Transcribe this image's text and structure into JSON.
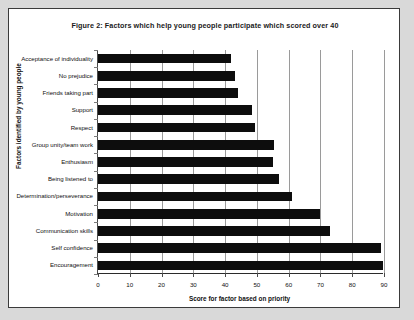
{
  "figure": {
    "title": "Figure 2: Factors which help young people participate which scored over 40",
    "xaxis_title": "Score for factor based on priority",
    "yaxis_title": "Factors identified by young people"
  },
  "chart_data": {
    "type": "bar",
    "orientation": "horizontal",
    "title": "Figure 2: Factors which help young people participate which scored over 40",
    "xlabel": "Score for factor based on priority",
    "ylabel": "Factors identified by young people",
    "xlim": [
      0,
      90
    ],
    "xticks": [
      0,
      10,
      20,
      30,
      40,
      50,
      60,
      70,
      80,
      90
    ],
    "xticklabels": [
      "0",
      "10",
      "20",
      "30",
      "40",
      "50",
      "60",
      "70",
      "80",
      "90"
    ],
    "grid": "vertical",
    "legend": "none",
    "bar_color": "#0d0d0d",
    "categories": [
      "Acceptance of individuality",
      "No prejudice",
      "Friends taking part",
      "Support",
      "Respect",
      "Group unity/team work",
      "Enthusiasm",
      "Being listened to",
      "Determination/perseverance",
      "Motivation",
      "Communication skills",
      "Self confidence",
      "Encouragement"
    ],
    "values": [
      42,
      43,
      44,
      48.5,
      49.5,
      55.5,
      55,
      57,
      61,
      70,
      73,
      89,
      90
    ]
  }
}
